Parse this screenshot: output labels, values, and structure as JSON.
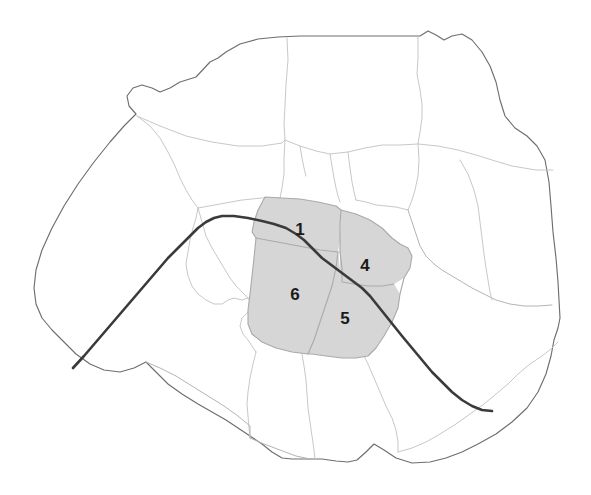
{
  "map": {
    "title": "Paris arrondissements map",
    "region_name": "Paris",
    "colors": {
      "background": "#ffffff",
      "highlight_fill": "#d6d6d6",
      "city_outline": "#6e6e6e",
      "district_border": "#c8c8c8",
      "river": "#3a3a3a",
      "label_text": "#1a1a1a"
    },
    "highlighted_districts": [
      {
        "id": "1",
        "label": "1",
        "x": 300,
        "y": 231
      },
      {
        "id": "4",
        "label": "4",
        "x": 365,
        "y": 267
      },
      {
        "id": "6",
        "label": "6",
        "x": 295,
        "y": 296
      },
      {
        "id": "5",
        "label": "5",
        "x": 345,
        "y": 320
      }
    ],
    "river": {
      "name": "seine-river",
      "visible": true
    },
    "legend": {
      "visible": false
    }
  }
}
